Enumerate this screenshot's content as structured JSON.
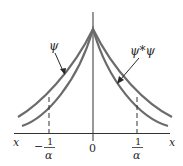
{
  "diagram": {
    "curves": [
      {
        "name": "psi",
        "label": "ψ",
        "description": "outer curve (wave function)"
      },
      {
        "name": "psi-star-psi",
        "label": "ψ*ψ",
        "description": "inner curve (probability density)"
      }
    ],
    "axis": {
      "x_left_label": "x",
      "x_right_label": "x",
      "origin_label": "0"
    },
    "markers": {
      "left": {
        "sign": "−",
        "numerator": "1",
        "denominator": "α"
      },
      "right": {
        "numerator": "1",
        "denominator": "α"
      }
    },
    "colors": {
      "curve": "#6b6b6b",
      "axis": "#333333",
      "text": "#2a2a2a",
      "background": "#ffffff"
    }
  }
}
